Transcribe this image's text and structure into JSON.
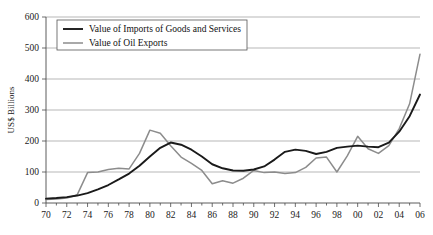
{
  "chart_data": {
    "type": "line",
    "title": "",
    "xlabel": "",
    "ylabel": "US$ Billions",
    "xlim": [
      1970,
      2006
    ],
    "ylim": [
      0,
      600
    ],
    "ytick_values": [
      0,
      100,
      200,
      300,
      400,
      500,
      600
    ],
    "ytick_labels": [
      "0",
      "100",
      "200",
      "300",
      "400",
      "500",
      "600"
    ],
    "xtick_values": [
      1970,
      1972,
      1974,
      1976,
      1978,
      1980,
      1982,
      1984,
      1986,
      1988,
      1990,
      1992,
      1994,
      1996,
      1998,
      2000,
      2002,
      2004,
      2006
    ],
    "xtick_labels": [
      "70",
      "72",
      "74",
      "76",
      "78",
      "80",
      "82",
      "84",
      "86",
      "88",
      "90",
      "92",
      "94",
      "96",
      "98",
      "00",
      "02",
      "04",
      "06"
    ],
    "x": [
      1970,
      1971,
      1972,
      1973,
      1974,
      1975,
      1976,
      1977,
      1978,
      1979,
      1980,
      1981,
      1982,
      1983,
      1984,
      1985,
      1986,
      1987,
      1988,
      1989,
      1990,
      1991,
      1992,
      1993,
      1994,
      1995,
      1996,
      1997,
      1998,
      1999,
      2000,
      2001,
      2002,
      2003,
      2004,
      2005,
      2006
    ],
    "grid": true,
    "legend_position": "top-left",
    "series": [
      {
        "name": "Value of Imports of Goods and Services",
        "color": "#1a1a1a",
        "width": 1.9,
        "values": [
          14,
          16,
          19,
          24,
          32,
          44,
          58,
          76,
          95,
          120,
          150,
          178,
          195,
          188,
          172,
          150,
          125,
          112,
          105,
          104,
          108,
          118,
          140,
          165,
          172,
          168,
          158,
          165,
          178,
          182,
          185,
          182,
          180,
          195,
          230,
          280,
          350
        ]
      },
      {
        "name": "Value of Oil Exports",
        "color": "#8c8c8c",
        "width": 1.5,
        "values": [
          11,
          13,
          16,
          26,
          98,
          100,
          108,
          112,
          110,
          160,
          235,
          225,
          185,
          148,
          128,
          105,
          62,
          72,
          64,
          80,
          105,
          98,
          100,
          95,
          98,
          115,
          145,
          148,
          100,
          152,
          215,
          175,
          160,
          185,
          240,
          320,
          480
        ]
      }
    ]
  },
  "legend": {
    "entries": [
      {
        "label": "Value of Imports of Goods and Services"
      },
      {
        "label": "Value of Oil Exports"
      }
    ]
  }
}
